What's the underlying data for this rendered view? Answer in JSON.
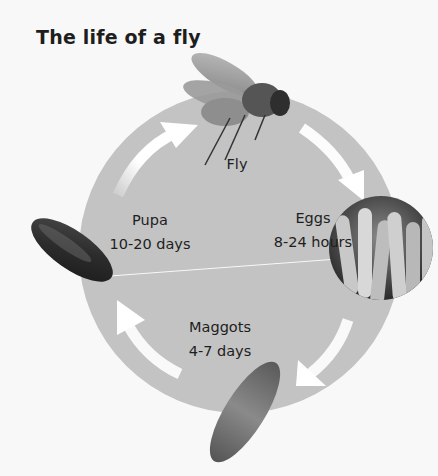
{
  "title": "The life of a fly",
  "colors": {
    "background": "#f8f8f8",
    "cycle_circle": "#c3c3c3",
    "arrow": "#ffffff",
    "text": "#1e1e1e"
  },
  "stages": [
    {
      "id": "fly",
      "name": "Fly",
      "duration": ""
    },
    {
      "id": "eggs",
      "name": "Eggs",
      "duration": "8-24 hours"
    },
    {
      "id": "maggots",
      "name": "Maggots",
      "duration": "4-7 days"
    },
    {
      "id": "pupa",
      "name": "Pupa",
      "duration": "10-20 days"
    }
  ],
  "arrows": [
    {
      "from": "pupa",
      "to": "fly"
    },
    {
      "from": "fly",
      "to": "eggs"
    },
    {
      "from": "eggs",
      "to": "maggots"
    },
    {
      "from": "maggots",
      "to": "pupa"
    }
  ]
}
